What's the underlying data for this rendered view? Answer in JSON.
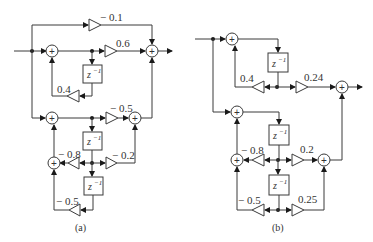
{
  "diagram_a": {
    "caption": "(a)",
    "gains": {
      "top": "− 0.1",
      "g06": "0.6",
      "g04": "0.4",
      "gm05_top": "− 0.5",
      "gm08": "− 0.8",
      "gm02": "− 0.2",
      "gm05_bottom": "− 0.5"
    },
    "delay_label": "z",
    "delay_exp": "−1",
    "adder_symbol": "+"
  },
  "diagram_b": {
    "caption": "(b)",
    "gains": {
      "g04": "0.4",
      "g024": "0.24",
      "gm08": "− 0.8",
      "g02": "0.2",
      "gm05": "− 0.5",
      "g025": "0.25"
    },
    "delay_label": "z",
    "delay_exp": "−1",
    "adder_symbol": "+"
  }
}
